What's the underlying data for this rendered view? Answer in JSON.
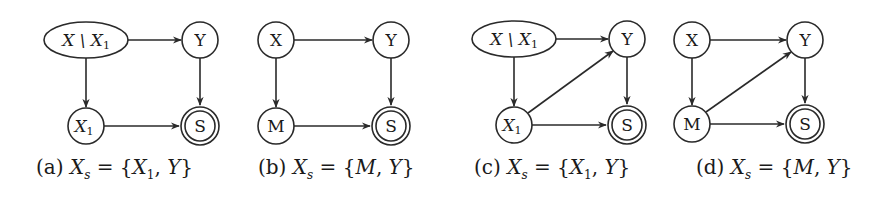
{
  "figure": {
    "panels": [
      {
        "id": "a",
        "caption": "(a) Xₛ = {X₁, Y}",
        "nodes": [
          {
            "id": "XminusX1",
            "label": "X \\ X₁",
            "shape": "ellipse",
            "cx": 86,
            "cy": 40,
            "rx": 42,
            "ry": 18
          },
          {
            "id": "Y",
            "label": "Y",
            "shape": "circle",
            "cx": 200,
            "cy": 40,
            "r": 18
          },
          {
            "id": "X1",
            "label": "X₁",
            "shape": "circle",
            "cx": 86,
            "cy": 126,
            "r": 18
          },
          {
            "id": "S",
            "label": "S",
            "shape": "double-circle",
            "cx": 200,
            "cy": 126,
            "r": 18
          }
        ],
        "edges": [
          [
            "XminusX1",
            "Y"
          ],
          [
            "XminusX1",
            "X1"
          ],
          [
            "Y",
            "S"
          ],
          [
            "X1",
            "S"
          ]
        ]
      },
      {
        "id": "b",
        "caption": "(b) Xₛ = {M, Y}",
        "nodes": [
          {
            "id": "X",
            "label": "X",
            "shape": "circle",
            "cx": 276,
            "cy": 40,
            "r": 18
          },
          {
            "id": "Y",
            "label": "Y",
            "shape": "circle",
            "cx": 391,
            "cy": 40,
            "r": 18
          },
          {
            "id": "M",
            "label": "M",
            "shape": "circle",
            "cx": 276,
            "cy": 126,
            "r": 18
          },
          {
            "id": "S",
            "label": "S",
            "shape": "double-circle",
            "cx": 391,
            "cy": 126,
            "r": 18
          }
        ],
        "edges": [
          [
            "X",
            "Y"
          ],
          [
            "X",
            "M"
          ],
          [
            "Y",
            "S"
          ],
          [
            "M",
            "S"
          ]
        ]
      },
      {
        "id": "c",
        "caption": "(c) Xₛ = {X₁, Y}",
        "nodes": [
          {
            "id": "XminusX1",
            "label": "X \\ X₁",
            "shape": "ellipse",
            "cx": 514,
            "cy": 39,
            "rx": 42,
            "ry": 18
          },
          {
            "id": "Y",
            "label": "Y",
            "shape": "circle",
            "cx": 627,
            "cy": 39,
            "r": 18
          },
          {
            "id": "X1",
            "label": "X₁",
            "shape": "circle",
            "cx": 514,
            "cy": 125,
            "r": 18
          },
          {
            "id": "S",
            "label": "S",
            "shape": "double-circle",
            "cx": 627,
            "cy": 125,
            "r": 18
          }
        ],
        "edges": [
          [
            "XminusX1",
            "Y"
          ],
          [
            "XminusX1",
            "X1"
          ],
          [
            "X1",
            "Y"
          ],
          [
            "Y",
            "S"
          ],
          [
            "X1",
            "S"
          ]
        ]
      },
      {
        "id": "d",
        "caption": "(d) Xₛ = {M, Y}",
        "nodes": [
          {
            "id": "X",
            "label": "X",
            "shape": "circle",
            "cx": 692,
            "cy": 40,
            "r": 18
          },
          {
            "id": "Y",
            "label": "Y",
            "shape": "circle",
            "cx": 805,
            "cy": 40,
            "r": 18
          },
          {
            "id": "M",
            "label": "M",
            "shape": "circle",
            "cx": 692,
            "cy": 124,
            "r": 18
          },
          {
            "id": "S",
            "label": "S",
            "shape": "double-circle",
            "cx": 805,
            "cy": 124,
            "r": 18
          }
        ],
        "edges": [
          [
            "X",
            "Y"
          ],
          [
            "X",
            "M"
          ],
          [
            "M",
            "Y"
          ],
          [
            "Y",
            "S"
          ],
          [
            "M",
            "S"
          ]
        ]
      }
    ]
  },
  "labels": {
    "a": {
      "top_left": "X \\ X",
      "top_left_sub": "1",
      "top_right": "Y",
      "bottom_left": "X",
      "bottom_left_sub": "1",
      "bottom_right": "S",
      "cap_prefix": "(a) ",
      "cap_var": "X",
      "cap_sub": "s",
      "cap_eq": " = {",
      "cap_m1": "X",
      "cap_m1_sub": "1",
      "cap_sep": ", ",
      "cap_m2": "Y",
      "cap_close": "}"
    },
    "b": {
      "top_left": "X",
      "top_right": "Y",
      "bottom_left": "M",
      "bottom_right": "S",
      "cap_prefix": "(b) ",
      "cap_var": "X",
      "cap_sub": "s",
      "cap_eq": " = {",
      "cap_m1": "M",
      "cap_sep": ", ",
      "cap_m2": "Y",
      "cap_close": "}"
    },
    "c": {
      "top_left": "X \\ X",
      "top_left_sub": "1",
      "top_right": "Y",
      "bottom_left": "X",
      "bottom_left_sub": "1",
      "bottom_right": "S",
      "cap_prefix": "(c) ",
      "cap_var": "X",
      "cap_sub": "s",
      "cap_eq": " = {",
      "cap_m1": "X",
      "cap_m1_sub": "1",
      "cap_sep": ", ",
      "cap_m2": "Y",
      "cap_close": "}"
    },
    "d": {
      "top_left": "X",
      "top_right": "Y",
      "bottom_left": "M",
      "bottom_right": "S",
      "cap_prefix": "(d) ",
      "cap_var": "X",
      "cap_sub": "s",
      "cap_eq": " = {",
      "cap_m1": "M",
      "cap_sep": ", ",
      "cap_m2": "Y",
      "cap_close": "}"
    }
  }
}
